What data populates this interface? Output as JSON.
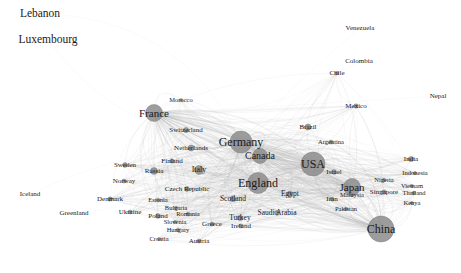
{
  "visualization": {
    "type": "force-directed-network-graph",
    "title": "",
    "background_color": "#ffffff",
    "node_color": "#8c8c8c",
    "node_outline_color": "#707070",
    "edge_color": "#b5b5b5",
    "label_color": "#1a1a1a",
    "width": 461,
    "height": 273
  },
  "chart_data": {
    "type": "scatter",
    "title": "",
    "xlabel": "",
    "ylabel": "",
    "grid": false,
    "legend": "none",
    "nodes": [
      {
        "label": "Lebanon",
        "x": 40,
        "y": 14,
        "size": 0,
        "font": 11.5
      },
      {
        "label": "Luxembourg",
        "x": 48,
        "y": 40,
        "size": 0,
        "font": 11.5
      },
      {
        "label": "Venezuela",
        "x": 360,
        "y": 28,
        "size": 0,
        "font": 7.0
      },
      {
        "label": "Colombia",
        "x": 359,
        "y": 61,
        "size": 0,
        "font": 7.0
      },
      {
        "label": "Chile",
        "x": 337,
        "y": 73,
        "size": 1.8,
        "font": 7.0
      },
      {
        "label": "Nepal",
        "x": 438,
        "y": 96,
        "size": 0,
        "font": 7.0
      },
      {
        "label": "Mexico",
        "x": 356,
        "y": 106,
        "size": 2.2,
        "font": 7.0
      },
      {
        "label": "Morocco",
        "x": 181,
        "y": 100,
        "size": 1.6,
        "font": 6.5
      },
      {
        "label": "France",
        "x": 154,
        "y": 113,
        "size": 8.5,
        "font": 11.0
      },
      {
        "label": "Switzerland",
        "x": 186,
        "y": 130,
        "size": 2.6,
        "font": 7.0
      },
      {
        "label": "Germany",
        "x": 241,
        "y": 142,
        "size": 11.0,
        "font": 12.0
      },
      {
        "label": "Brazil",
        "x": 308,
        "y": 127,
        "size": 3.0,
        "font": 7.0
      },
      {
        "label": "Argentina",
        "x": 331,
        "y": 142,
        "size": 2.0,
        "font": 6.5
      },
      {
        "label": "Netherlands",
        "x": 191,
        "y": 148,
        "size": 3.0,
        "font": 7.0
      },
      {
        "label": "Canada",
        "x": 260,
        "y": 156,
        "size": 7.5,
        "font": 10.0
      },
      {
        "label": "USA",
        "x": 313,
        "y": 164,
        "size": 12.0,
        "font": 12.0
      },
      {
        "label": "India",
        "x": 411,
        "y": 159,
        "size": 2.6,
        "font": 7.0
      },
      {
        "label": "Sweden",
        "x": 125,
        "y": 165,
        "size": 2.4,
        "font": 7.0
      },
      {
        "label": "Finland",
        "x": 172,
        "y": 161,
        "size": 2.2,
        "font": 7.0
      },
      {
        "label": "Russia",
        "x": 154,
        "y": 171,
        "size": 3.4,
        "font": 7.0
      },
      {
        "label": "Italy",
        "x": 199,
        "y": 170,
        "size": 4.4,
        "font": 8.0
      },
      {
        "label": "Israel",
        "x": 334,
        "y": 172,
        "size": 2.4,
        "font": 7.0
      },
      {
        "label": "Indonesia",
        "x": 415,
        "y": 173,
        "size": 1.6,
        "font": 6.5
      },
      {
        "label": "Nigeria",
        "x": 384,
        "y": 180,
        "size": 1.8,
        "font": 6.5
      },
      {
        "label": "Norway",
        "x": 124,
        "y": 181,
        "size": 2.0,
        "font": 7.0
      },
      {
        "label": "England",
        "x": 258,
        "y": 183,
        "size": 10.5,
        "font": 12.0
      },
      {
        "label": "Japan",
        "x": 352,
        "y": 187,
        "size": 8.5,
        "font": 11.0
      },
      {
        "label": "Vietnam",
        "x": 412,
        "y": 186,
        "size": 1.6,
        "font": 6.5
      },
      {
        "label": "Czech Republic",
        "x": 187,
        "y": 189,
        "size": 2.4,
        "font": 7.0
      },
      {
        "label": "Singapore",
        "x": 384,
        "y": 192,
        "size": 2.2,
        "font": 7.0
      },
      {
        "label": "Malaysia",
        "x": 352,
        "y": 195,
        "size": 1.8,
        "font": 6.5
      },
      {
        "label": "Thailand",
        "x": 414,
        "y": 193,
        "size": 1.8,
        "font": 6.5
      },
      {
        "label": "Egypt",
        "x": 290,
        "y": 194,
        "size": 2.8,
        "font": 7.5
      },
      {
        "label": "Iran",
        "x": 332,
        "y": 199,
        "size": 2.0,
        "font": 7.0
      },
      {
        "label": "Denmark",
        "x": 110,
        "y": 199,
        "size": 2.2,
        "font": 7.0
      },
      {
        "label": "Iceland",
        "x": 30,
        "y": 194,
        "size": 0,
        "font": 7.0
      },
      {
        "label": "Estonia",
        "x": 158,
        "y": 200,
        "size": 1.8,
        "font": 6.5
      },
      {
        "label": "Scotland",
        "x": 233,
        "y": 199,
        "size": 2.8,
        "font": 7.5
      },
      {
        "label": "Kenya",
        "x": 412,
        "y": 203,
        "size": 1.6,
        "font": 6.5
      },
      {
        "label": "Pakistan",
        "x": 346,
        "y": 209,
        "size": 1.8,
        "font": 6.5
      },
      {
        "label": "Ukraine",
        "x": 130,
        "y": 212,
        "size": 2.0,
        "font": 7.0
      },
      {
        "label": "Bulgaria",
        "x": 176,
        "y": 208,
        "size": 1.8,
        "font": 6.5
      },
      {
        "label": "Saudi Arabia",
        "x": 277,
        "y": 213,
        "size": 2.4,
        "font": 7.5
      },
      {
        "label": "Romania",
        "x": 188,
        "y": 214,
        "size": 1.8,
        "font": 6.5
      },
      {
        "label": "Greenland",
        "x": 74,
        "y": 213,
        "size": 0,
        "font": 7.0
      },
      {
        "label": "Poland",
        "x": 158,
        "y": 216,
        "size": 2.4,
        "font": 7.0
      },
      {
        "label": "Turkey",
        "x": 240,
        "y": 218,
        "size": 2.6,
        "font": 7.5
      },
      {
        "label": "Slovenia",
        "x": 175,
        "y": 222,
        "size": 1.6,
        "font": 6.5
      },
      {
        "label": "Greece",
        "x": 212,
        "y": 224,
        "size": 2.0,
        "font": 7.0
      },
      {
        "label": "Ireland",
        "x": 241,
        "y": 226,
        "size": 2.0,
        "font": 7.0
      },
      {
        "label": "China",
        "x": 381,
        "y": 229,
        "size": 13.0,
        "font": 12.0
      },
      {
        "label": "Hungary",
        "x": 178,
        "y": 230,
        "size": 1.8,
        "font": 6.5
      },
      {
        "label": "Croatia",
        "x": 159,
        "y": 239,
        "size": 1.6,
        "font": 6.5
      },
      {
        "label": "Austria",
        "x": 199,
        "y": 241,
        "size": 2.0,
        "font": 7.0
      }
    ],
    "hub_nodes": [
      "China",
      "USA",
      "Germany",
      "England",
      "France",
      "Japan",
      "Canada"
    ],
    "node_count": 54,
    "edge_style": "curved-translucent"
  }
}
